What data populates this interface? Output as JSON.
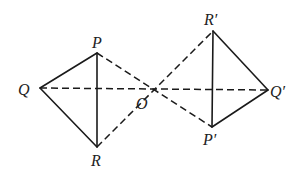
{
  "diagram": {
    "type": "geometry",
    "points": {
      "P": {
        "label": "P",
        "x": 97,
        "y": 53
      },
      "Q": {
        "label": "Q",
        "x": 40,
        "y": 88
      },
      "R": {
        "label": "R",
        "x": 97,
        "y": 147
      },
      "O": {
        "label": "O",
        "x": 150,
        "y": 90
      },
      "P_prime": {
        "label": "P′",
        "x": 212,
        "y": 127
      },
      "Q_prime": {
        "label": "Q′",
        "x": 268,
        "y": 90
      },
      "R_prime": {
        "label": "R′",
        "x": 213,
        "y": 31
      }
    },
    "solid_segments": [
      [
        "P",
        "Q"
      ],
      [
        "Q",
        "R"
      ],
      [
        "P",
        "R"
      ],
      [
        "R_prime",
        "Q_prime"
      ],
      [
        "Q_prime",
        "P_prime"
      ],
      [
        "R_prime",
        "P_prime"
      ]
    ],
    "dashed_segments": [
      [
        "P",
        "P_prime"
      ],
      [
        "Q",
        "Q_prime"
      ],
      [
        "R",
        "R_prime"
      ]
    ],
    "colors": {
      "stroke": "#1a1a1a",
      "text": "#222222",
      "background": "#ffffff"
    }
  }
}
